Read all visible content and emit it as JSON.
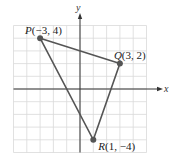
{
  "diagram": {
    "type": "coordinate-plane-triangle",
    "axes": {
      "x_label": "x",
      "y_label": "y",
      "range": [
        -5,
        5
      ]
    },
    "points": [
      {
        "name": "P",
        "x": -3,
        "y": 4,
        "label": "(−3, 4)"
      },
      {
        "name": "Q",
        "x": 3,
        "y": 2,
        "label": "(3, 2)"
      },
      {
        "name": "R",
        "x": 1,
        "y": -4,
        "label": "(1, −4)"
      }
    ],
    "colors": {
      "grid": "#d9d9d9",
      "axis": "#333333",
      "edge": "#555555",
      "point": "#555555"
    }
  }
}
